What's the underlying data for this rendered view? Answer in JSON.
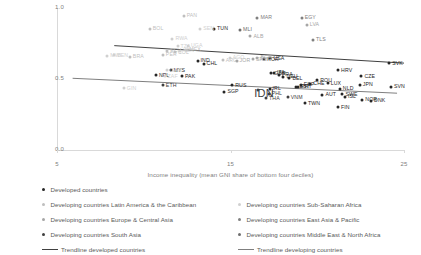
{
  "chart_data": {
    "type": "scatter",
    "title": "",
    "xlabel": "Income inequality (mean GNI share of bottom four deciles)",
    "ylabel": "Intergenerational income elasticity",
    "xlim": [
      5,
      25
    ],
    "ylim": [
      0.0,
      1.0
    ],
    "xticks": [
      "5",
      "15",
      "25"
    ],
    "yticks": [
      "0.0",
      "0.5",
      "1.0"
    ],
    "grid": false,
    "legend_position": "bottom",
    "series": [
      {
        "name": "Developed countries",
        "color": "#262626",
        "points": [
          {
            "label": "TUN",
            "x": 14.05,
            "y": 0.855
          },
          {
            "label": "IND",
            "x": 13.1,
            "y": 0.63
          },
          {
            "label": "CHL",
            "x": 13.45,
            "y": 0.607
          },
          {
            "label": "MYS",
            "x": 11.55,
            "y": 0.56
          },
          {
            "label": "PAK",
            "x": 12.2,
            "y": 0.52
          },
          {
            "label": "NPL",
            "x": 10.7,
            "y": 0.527
          },
          {
            "label": "SVK",
            "x": 24.15,
            "y": 0.61
          },
          {
            "label": "CZE",
            "x": 22.55,
            "y": 0.52
          },
          {
            "label": "JPN",
            "x": 22.45,
            "y": 0.46
          },
          {
            "label": "LUX",
            "x": 20.6,
            "y": 0.47
          },
          {
            "label": "SVN",
            "x": 24.25,
            "y": 0.445
          },
          {
            "label": "NLD",
            "x": 21.3,
            "y": 0.432
          },
          {
            "label": "SWE",
            "x": 21.45,
            "y": 0.393
          },
          {
            "label": "AUT",
            "x": 20.3,
            "y": 0.388
          },
          {
            "label": "DNK",
            "x": 23.1,
            "y": 0.345
          },
          {
            "label": "FIN",
            "x": 21.2,
            "y": 0.3
          },
          {
            "label": "NOR",
            "x": 22.6,
            "y": 0.352
          },
          {
            "label": "ESP",
            "x": 19.05,
            "y": 0.46
          },
          {
            "label": "EST",
            "x": 18.8,
            "y": 0.443
          },
          {
            "label": "USA",
            "x": 17.3,
            "y": 0.647
          },
          {
            "label": "KOR",
            "x": 16.95,
            "y": 0.64
          },
          {
            "label": "ITA",
            "x": 17.5,
            "y": 0.545
          },
          {
            "label": "GBR",
            "x": 17.35,
            "y": 0.54
          },
          {
            "label": "FRA",
            "x": 17.8,
            "y": 0.53
          },
          {
            "label": "DEU",
            "x": 18.05,
            "y": 0.515
          },
          {
            "label": "BEL",
            "x": 18.4,
            "y": 0.505
          },
          {
            "label": "PRT",
            "x": 18.9,
            "y": 0.445
          },
          {
            "label": "IRL",
            "x": 17.25,
            "y": 0.43
          },
          {
            "label": "TWN",
            "x": 19.3,
            "y": 0.33
          },
          {
            "label": "SGP",
            "x": 14.65,
            "y": 0.41
          },
          {
            "label": "RUS",
            "x": 15.1,
            "y": 0.455
          },
          {
            "label": "ROU",
            "x": 20.0,
            "y": 0.492
          },
          {
            "label": "HRV",
            "x": 21.2,
            "y": 0.56
          },
          {
            "label": "ISL",
            "x": 21.6,
            "y": 0.375
          },
          {
            "label": "CHE",
            "x": 19.6,
            "y": 0.465
          }
        ]
      },
      {
        "name": "Developing countries Latin America & the Caribbean",
        "color": "#bfbfbf",
        "points": [
          {
            "label": "PAN",
            "x": 12.3,
            "y": 0.945
          },
          {
            "label": "BOL",
            "x": 10.35,
            "y": 0.855
          },
          {
            "label": "BRA",
            "x": 9.2,
            "y": 0.655
          },
          {
            "label": "ECU",
            "x": 11.35,
            "y": 0.7
          },
          {
            "label": "COL",
            "x": 11.8,
            "y": 0.688
          },
          {
            "label": "PER",
            "x": 11.1,
            "y": 0.672
          },
          {
            "label": "ARG",
            "x": 14.55,
            "y": 0.632
          },
          {
            "label": "MEX",
            "x": 12.45,
            "y": 0.706
          }
        ]
      },
      {
        "name": "Developing countries Europe & Central Asia",
        "color": "#a6a6a6",
        "points": [
          {
            "label": "LVA",
            "x": 19.4,
            "y": 0.88
          },
          {
            "label": "ALB",
            "x": 16.15,
            "y": 0.8
          },
          {
            "label": "BGR",
            "x": 16.55,
            "y": 0.65
          },
          {
            "label": "JOR",
            "x": 15.35,
            "y": 0.627
          },
          {
            "label": "SRB",
            "x": 16.3,
            "y": 0.638
          }
        ]
      },
      {
        "name": "Developing countries South Asia",
        "color": "#404040",
        "points": [
          {
            "label": "ETH",
            "x": 11.1,
            "y": 0.455
          },
          {
            "label": "IDN",
            "x": 16.6,
            "y": 0.425
          },
          {
            "label": "PHL",
            "x": 17.2,
            "y": 0.395
          },
          {
            "label": "THA",
            "x": 17.05,
            "y": 0.365
          },
          {
            "label": "VNM",
            "x": 18.3,
            "y": 0.37
          }
        ]
      },
      {
        "name": "Developing countries Sub-Saharan Africa",
        "color": "#d0d0d0",
        "points": [
          {
            "label": "SEN",
            "x": 13.25,
            "y": 0.852
          },
          {
            "label": "RWA",
            "x": 11.65,
            "y": 0.785
          },
          {
            "label": "UGA",
            "x": 12.55,
            "y": 0.735
          },
          {
            "label": "TZA",
            "x": 11.95,
            "y": 0.73
          },
          {
            "label": "KEN",
            "x": 12.1,
            "y": 0.7
          },
          {
            "label": "BEN",
            "x": 8.3,
            "y": 0.667
          },
          {
            "label": "MWI",
            "x": 7.9,
            "y": 0.665
          },
          {
            "label": "GIN",
            "x": 8.85,
            "y": 0.435
          },
          {
            "label": "GHA",
            "x": 11.35,
            "y": 0.56
          },
          {
            "label": "ZAF",
            "x": 11.2,
            "y": 0.52
          },
          {
            "label": "AGO",
            "x": 14.95,
            "y": 0.65
          }
        ]
      },
      {
        "name": "Developing countries East Asia & Pacific",
        "color": "#808080",
        "points": [
          {
            "label": "TLS",
            "x": 19.75,
            "y": 0.775
          },
          {
            "label": "MAR",
            "x": 16.55,
            "y": 0.93
          },
          {
            "label": "EGY",
            "x": 19.1,
            "y": 0.93
          }
        ]
      },
      {
        "name": "Developing countries Middle East & North Africa",
        "color": "#6e6e6e",
        "points": [
          {
            "label": "MLI",
            "x": 15.55,
            "y": 0.845
          }
        ]
      }
    ],
    "trendlines": [
      {
        "name": "Trendline developed countries",
        "color": "#404040",
        "x1": 8.3,
        "y1": 0.735,
        "x2": 25.0,
        "y2": 0.612
      },
      {
        "name": "Trendline developing countries",
        "color": "#7f7f7f",
        "x1": 5.9,
        "y1": 0.505,
        "x2": 24.6,
        "y2": 0.4
      }
    ]
  },
  "legend": {
    "items": [
      {
        "label": "Developed countries",
        "marker": "dot",
        "color": "#262626"
      },
      {
        "label": "Developing countries Latin America & the Caribbean",
        "marker": "dot",
        "color": "#bfbfbf"
      },
      {
        "label": "Developing countries Europe & Central Asia",
        "marker": "dot",
        "color": "#a6a6a6"
      },
      {
        "label": "Developing countries South Asia",
        "marker": "dot",
        "color": "#404040"
      },
      {
        "label": "Trendline developed countries",
        "marker": "line",
        "color": "#404040"
      },
      {
        "label": "Developing countries Sub-Saharan Africa",
        "marker": "dot",
        "color": "#d0d0d0"
      },
      {
        "label": "Developing countries East Asia & Pacific",
        "marker": "dot",
        "color": "#808080"
      },
      {
        "label": "Developing countries Middle East & North Africa",
        "marker": "dot",
        "color": "#6e6e6e"
      },
      {
        "label": "Trendline developing countries",
        "marker": "line",
        "color": "#7f7f7f"
      }
    ]
  }
}
